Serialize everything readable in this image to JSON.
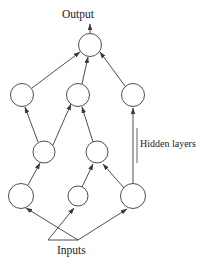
{
  "diagram": {
    "type": "node-link-graph",
    "labels": {
      "output": "Output",
      "inputs": "Inputs",
      "hidden": "Hidden layers"
    },
    "style": {
      "stroke": "#3a3a3a",
      "node_fill": "#ffffff",
      "background": "#ffffff",
      "text_color": "#1a1a1a",
      "stroke_width": 0.9
    },
    "nodes": [
      {
        "id": "out",
        "cx": 90,
        "cy": 45,
        "r": 11.5,
        "layer": "output"
      },
      {
        "id": "h2a",
        "cx": 22,
        "cy": 95,
        "r": 11.5,
        "layer": "hidden-2"
      },
      {
        "id": "h2b",
        "cx": 78,
        "cy": 95,
        "r": 11.5,
        "layer": "hidden-2"
      },
      {
        "id": "h2c",
        "cx": 133,
        "cy": 95,
        "r": 11.5,
        "layer": "hidden-2"
      },
      {
        "id": "h1a",
        "cx": 44,
        "cy": 152,
        "r": 11.0,
        "layer": "hidden-1"
      },
      {
        "id": "h1b",
        "cx": 97,
        "cy": 152,
        "r": 11.0,
        "layer": "hidden-1"
      },
      {
        "id": "in1",
        "cx": 21,
        "cy": 196,
        "r": 12.5,
        "layer": "input"
      },
      {
        "id": "in2",
        "cx": 78,
        "cy": 196,
        "r": 10.0,
        "layer": "input"
      },
      {
        "id": "in3",
        "cx": 133,
        "cy": 196,
        "r": 12.5,
        "layer": "input"
      }
    ],
    "edges": [
      {
        "from": "h2a",
        "to": "out"
      },
      {
        "from": "h2b",
        "to": "out"
      },
      {
        "from": "h2c",
        "to": "out"
      },
      {
        "from": "h1a",
        "to": "h2a"
      },
      {
        "from": "h1a",
        "to": "h2b"
      },
      {
        "from": "h1b",
        "to": "h2b"
      },
      {
        "from": "in3",
        "to": "h2c"
      },
      {
        "from": "in1",
        "to": "h1a"
      },
      {
        "from": "in2",
        "to": "h1b"
      },
      {
        "from": "in3",
        "to": "h1b"
      },
      {
        "from": "fan",
        "to": "in1"
      },
      {
        "from": "fan",
        "to": "in2"
      },
      {
        "from": "fan",
        "to": "in3"
      }
    ],
    "output_arrow": {
      "x": 90,
      "y_from": 33,
      "y_to": 24
    },
    "fan_point": {
      "x": 78,
      "y": 240
    },
    "divider_line": {
      "x": 137,
      "y_from": 128,
      "y_to": 163
    }
  }
}
